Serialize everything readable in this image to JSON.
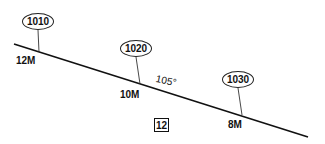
{
  "diagram": {
    "type": "depth-contour-profile",
    "line": {
      "x1": 14,
      "y1": 44,
      "x2": 308,
      "y2": 137,
      "color": "#111111"
    },
    "callouts": [
      {
        "label": "1010",
        "x": 22,
        "y": 13,
        "leader": {
          "x1": 38,
          "y1": 30,
          "x2": 39,
          "y2": 52
        }
      },
      {
        "label": "1020",
        "x": 120,
        "y": 40,
        "leader": {
          "x1": 136,
          "y1": 57,
          "x2": 140,
          "y2": 84
        }
      },
      {
        "label": "1030",
        "x": 222,
        "y": 71,
        "leader": {
          "x1": 238,
          "y1": 88,
          "x2": 242,
          "y2": 115
        }
      }
    ],
    "depth_labels": [
      {
        "label": "12M",
        "x": 16,
        "y": 56
      },
      {
        "label": "10M",
        "x": 120,
        "y": 90
      },
      {
        "label": "8M",
        "x": 228,
        "y": 120
      }
    ],
    "angle_label": "105°",
    "box_label": "12"
  }
}
